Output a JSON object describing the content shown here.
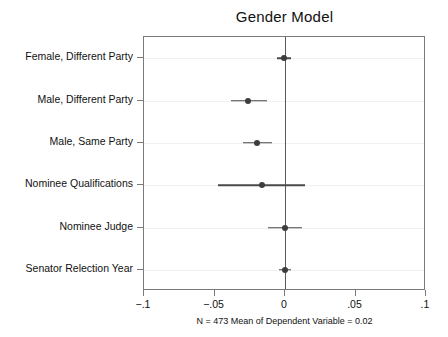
{
  "chart_data": {
    "type": "scatter",
    "title": "Gender Model",
    "subtitle": "",
    "xlabel": "",
    "ylabel": "",
    "xlim": [
      -0.1,
      0.1
    ],
    "xticks": [
      -0.1,
      -0.05,
      0,
      0.05,
      0.1
    ],
    "xticklabels": [
      "−.1",
      "−.05",
      "0",
      ".05",
      ".1"
    ],
    "grid": true,
    "grid_axis": "y",
    "legend": "none",
    "reference_line": 0,
    "orientation": "horizontal",
    "note": "N = 473 Mean of Dependent Variable = 0.02",
    "categories": [
      "Female, Different Party",
      "Male, Different Party",
      "Male, Same Party",
      "Nominee Qualifications",
      "Nominee Judge",
      "Senator Relection Year"
    ],
    "series": [
      {
        "name": "Coefficient estimate",
        "values": [
          -0.001,
          -0.0264,
          -0.0198,
          -0.016,
          0.0,
          0.0
        ],
        "ci_low": [
          -0.006,
          -0.038,
          -0.03,
          -0.0475,
          -0.012,
          -0.004
        ],
        "ci_high": [
          0.004,
          -0.013,
          -0.009,
          0.014,
          0.012,
          0.004
        ]
      }
    ],
    "points": [
      {
        "label": "Female, Different Party",
        "estimate": -0.001,
        "ci_low": -0.006,
        "ci_high": 0.004
      },
      {
        "label": "Male, Different Party",
        "estimate": -0.0264,
        "ci_low": -0.038,
        "ci_high": -0.013
      },
      {
        "label": "Male, Same Party",
        "estimate": -0.0198,
        "ci_low": -0.03,
        "ci_high": -0.009
      },
      {
        "label": "Nominee Qualifications",
        "estimate": -0.016,
        "ci_low": -0.0475,
        "ci_high": 0.014
      },
      {
        "label": "Nominee Judge",
        "estimate": 0.0,
        "ci_low": -0.012,
        "ci_high": 0.012
      },
      {
        "label": "Senator Relection Year",
        "estimate": 0.0,
        "ci_low": -0.004,
        "ci_high": 0.004
      }
    ],
    "colors": {
      "marker": "#3d3d3d",
      "ci": "#4a4a4a",
      "frame": "#7a7a7a",
      "grid": "#f1f1f1",
      "zero_line": "#595959",
      "text": "#111111",
      "background": "#ffffff"
    }
  }
}
